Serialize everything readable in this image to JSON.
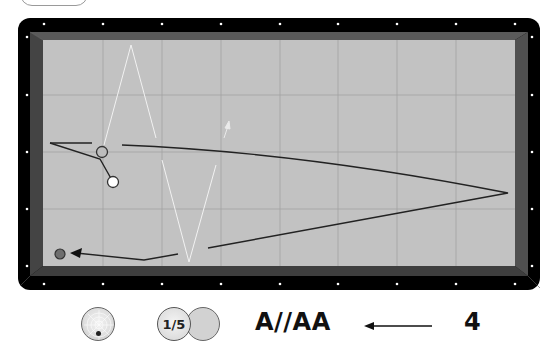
{
  "top_button": {
    "label": ""
  },
  "table": {
    "rail_color": "#000000",
    "cushion_color": "#4a4a4a",
    "cloth_color": "#c0c0c0",
    "grid_color": "#9a9a9a",
    "diamond_color": "#ffffff"
  },
  "balls": {
    "cue_ball": {
      "color": "#ffffff",
      "x": 113,
      "y": 182
    },
    "object_ball_1": {
      "color": "#bdbdbd",
      "x": 102,
      "y": 152
    },
    "object_ball_2": {
      "color": "#6e6e6e",
      "x": 60,
      "y": 254
    }
  },
  "controls": {
    "cue_tip_position": "bottom",
    "ball_thickness": "1/5",
    "system_name": "A//AA",
    "direction_arrow": "left-arrow",
    "value": "4"
  }
}
